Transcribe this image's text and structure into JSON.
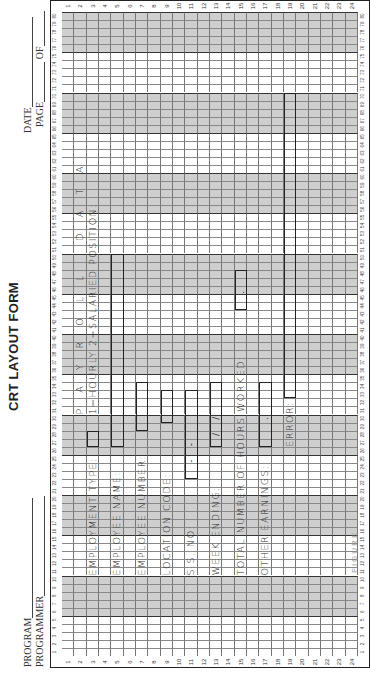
{
  "form": {
    "title": "CRT LAYOUT FORM",
    "header_fields": {
      "program_label": "PROGRAM",
      "programmer_label": "PROGRAMMER",
      "date_label": "DATE",
      "page_label": "PAGE",
      "of_label": "OF"
    },
    "grid": {
      "rows": 24,
      "columns": 80,
      "shaded_column_bands": [
        [
          6,
          10
        ],
        [
          16,
          20
        ],
        [
          26,
          30
        ],
        [
          36,
          40
        ],
        [
          46,
          50
        ],
        [
          56,
          60
        ],
        [
          66,
          70
        ],
        [
          76,
          80
        ]
      ],
      "row_numbers": [
        "1",
        "2",
        "3",
        "4",
        "5",
        "6",
        "7",
        "8",
        "9",
        "10",
        "11",
        "12",
        "13",
        "14",
        "15",
        "16",
        "17",
        "18",
        "19",
        "20",
        "21",
        "22",
        "23",
        "24"
      ]
    },
    "screen_heading": "P A Y R O L L   D A T A",
    "fields": [
      {
        "label": "EMPLOYMENT TYPE:",
        "row": 3,
        "col": 11,
        "input_row": 3,
        "input_col_start": 27,
        "input_col_end": 28,
        "input_text": ""
      },
      {
        "label": "EMPLOYEE NAME:",
        "row": 5,
        "col": 11,
        "input_row": 5,
        "input_col_start": 27,
        "input_col_end": 50,
        "input_text": ""
      },
      {
        "label": "EMPLOYEE NUMBER:",
        "row": 7,
        "col": 11,
        "input_row": 7,
        "input_col_start": 29,
        "input_col_end": 34,
        "input_text": ""
      },
      {
        "label": "LOCATION CODE:",
        "row": 9,
        "col": 11,
        "input_row": 9,
        "input_col_start": 30,
        "input_col_end": 33,
        "input_text": ""
      },
      {
        "label": "S.S. NO:",
        "row": 11,
        "col": 11,
        "input_row": 11,
        "input_col_start": 23,
        "input_col_end": 33,
        "input_text": "   -  -   "
      },
      {
        "label": "WEEK ENDING:",
        "row": 13,
        "col": 11,
        "input_row": 13,
        "input_col_start": 27,
        "input_col_end": 34,
        "input_text": "  /  /  "
      },
      {
        "label": "TOTAL NUMBER OF HOURS WORKED:",
        "row": 15,
        "col": 11,
        "input_row": 15,
        "input_col_start": 44,
        "input_col_end": 48,
        "input_text": "   .  "
      },
      {
        "label": "OTHER EARNINGS:",
        "row": 17,
        "col": 11,
        "input_row": 17,
        "input_col_start": 27,
        "input_col_end": 34,
        "input_text": "     .  "
      },
      {
        "label": "ERROR:",
        "row": 19,
        "col": 27,
        "input_row": 19,
        "input_col_start": 33,
        "input_col_end": 70,
        "input_text": ""
      }
    ],
    "employment_type_legend": {
      "text": "1=HOURLY 2=SALARIED POSITION:",
      "row": 3,
      "col": 31
    },
    "caption": "FIGURE"
  }
}
